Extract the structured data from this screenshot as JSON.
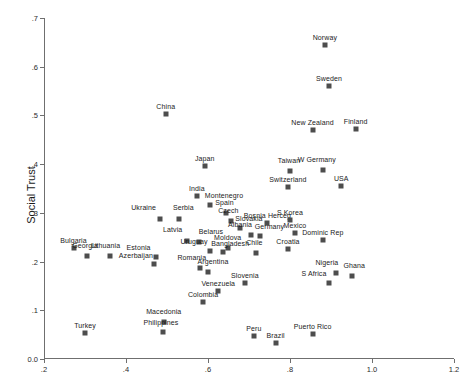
{
  "chart_data": {
    "type": "scatter",
    "title": "",
    "xlabel": "",
    "ylabel": "Social Trust",
    "xlim": [
      0.2,
      1.2
    ],
    "ylim": [
      0.0,
      0.7
    ],
    "xticks": [
      0.2,
      0.4,
      0.6,
      0.8,
      1.0,
      1.2
    ],
    "xtick_labels": [
      ".2",
      ".4",
      ".6",
      ".8",
      "1.0",
      "1.2"
    ],
    "yticks": [
      0.0,
      0.1,
      0.2,
      0.3,
      0.4,
      0.5,
      0.6,
      0.7
    ],
    "ytick_labels": [
      "0.0",
      ".1",
      ".2",
      ".3",
      ".4",
      ".5",
      ".6",
      ".7"
    ],
    "grid": false,
    "legend": false,
    "marker_color": "#4d4d4d",
    "axis_color": "#6f6f6f",
    "points": [
      {
        "label": "Norway",
        "x": 0.885,
        "y": 0.645
      },
      {
        "label": "Sweden",
        "x": 0.895,
        "y": 0.561
      },
      {
        "label": "China",
        "x": 0.497,
        "y": 0.502
      },
      {
        "label": "Finland",
        "x": 0.96,
        "y": 0.472
      },
      {
        "label": "New Zealand",
        "x": 0.855,
        "y": 0.47
      },
      {
        "label": "Japan",
        "x": 0.592,
        "y": 0.396
      },
      {
        "label": "W Germany",
        "x": 0.88,
        "y": 0.388
      },
      {
        "label": "Taiwan",
        "x": 0.8,
        "y": 0.385
      },
      {
        "label": "USA",
        "x": 0.925,
        "y": 0.355
      },
      {
        "label": "Switzerland",
        "x": 0.795,
        "y": 0.354
      },
      {
        "label": "India",
        "x": 0.573,
        "y": 0.335
      },
      {
        "label": "Montenegro",
        "x": 0.605,
        "y": 0.316
      },
      {
        "label": "Spain",
        "x": 0.645,
        "y": 0.3
      },
      {
        "label": "Ukraine",
        "x": 0.482,
        "y": 0.288
      },
      {
        "label": "Serbia",
        "x": 0.53,
        "y": 0.287
      },
      {
        "label": "Czech",
        "x": 0.657,
        "y": 0.283
      },
      {
        "label": "Slovakia",
        "x": 0.678,
        "y": 0.269
      },
      {
        "label": "Bosnia Herceg",
        "x": 0.745,
        "y": 0.28
      },
      {
        "label": "S Korea",
        "x": 0.8,
        "y": 0.286
      },
      {
        "label": "Albania",
        "x": 0.705,
        "y": 0.254
      },
      {
        "label": "Germany",
        "x": 0.728,
        "y": 0.253
      },
      {
        "label": "Mexico",
        "x": 0.812,
        "y": 0.258
      },
      {
        "label": "Dominic Rep",
        "x": 0.88,
        "y": 0.245
      },
      {
        "label": "Latvia",
        "x": 0.548,
        "y": 0.243
      },
      {
        "label": "Belarus",
        "x": 0.578,
        "y": 0.24
      },
      {
        "label": "Moldova",
        "x": 0.648,
        "y": 0.228
      },
      {
        "label": "Uruguay",
        "x": 0.605,
        "y": 0.221
      },
      {
        "label": "Bangladesh",
        "x": 0.637,
        "y": 0.219
      },
      {
        "label": "Chile",
        "x": 0.718,
        "y": 0.217
      },
      {
        "label": "Croatia",
        "x": 0.795,
        "y": 0.226
      },
      {
        "label": "Bulgaria",
        "x": 0.272,
        "y": 0.228
      },
      {
        "label": "Georgia",
        "x": 0.305,
        "y": 0.211
      },
      {
        "label": "Lithuania",
        "x": 0.36,
        "y": 0.211
      },
      {
        "label": "Estonia",
        "x": 0.472,
        "y": 0.209
      },
      {
        "label": "Azerbaijan",
        "x": 0.468,
        "y": 0.196
      },
      {
        "label": "Romania",
        "x": 0.58,
        "y": 0.186
      },
      {
        "label": "Argentina",
        "x": 0.6,
        "y": 0.178
      },
      {
        "label": "Nigeria",
        "x": 0.912,
        "y": 0.177
      },
      {
        "label": "Ghana",
        "x": 0.952,
        "y": 0.171
      },
      {
        "label": "S Africa",
        "x": 0.895,
        "y": 0.157
      },
      {
        "label": "Slovenia",
        "x": 0.69,
        "y": 0.156
      },
      {
        "label": "Venezuela",
        "x": 0.625,
        "y": 0.14
      },
      {
        "label": "Colombia",
        "x": 0.588,
        "y": 0.118
      },
      {
        "label": "Macedonia",
        "x": 0.492,
        "y": 0.075
      },
      {
        "label": "Philippines",
        "x": 0.49,
        "y": 0.056
      },
      {
        "label": "Turkey",
        "x": 0.3,
        "y": 0.053
      },
      {
        "label": "Peru",
        "x": 0.712,
        "y": 0.048
      },
      {
        "label": "Puerto Rico",
        "x": 0.855,
        "y": 0.052
      },
      {
        "label": "Brazil",
        "x": 0.765,
        "y": 0.032
      }
    ],
    "label_offsets": {
      "Ukraine": {
        "dx": -16,
        "dy": -4
      },
      "Serbia": {
        "dx": 4,
        "dy": -4
      },
      "Latvia": {
        "dx": -14,
        "dy": -4
      },
      "Belarus": {
        "dx": 12,
        "dy": -3
      },
      "Estonia": {
        "dx": -17,
        "dy": -2
      },
      "Azerbaijan": {
        "dx": -18,
        "dy": -1
      },
      "Georgia": {
        "dx": -2,
        "dy": -3
      },
      "Lithuania": {
        "dx": -4,
        "dy": -3
      },
      "Uruguay": {
        "dx": -16,
        "dy": -2
      },
      "Bangladesh": {
        "dx": 7,
        "dy": -1
      },
      "Albania": {
        "dx": -11,
        "dy": -3
      },
      "Germany": {
        "dx": 9,
        "dy": -2
      },
      "Argentina": {
        "dx": 5,
        "dy": -3
      },
      "Romania": {
        "dx": -8,
        "dy": -3
      },
      "Nigeria": {
        "dx": -9,
        "dy": -3
      },
      "Ghana": {
        "dx": 2,
        "dy": -3
      },
      "S Africa": {
        "dx": -15,
        "dy": -2
      },
      "Taiwan": {
        "dx": -1,
        "dy": -3
      },
      "W Germany": {
        "dx": -6,
        "dy": -3
      },
      "Philippines": {
        "dx": -2,
        "dy": -2
      },
      "Macedonia": {
        "dx": 0,
        "dy": -3
      },
      "Montenegro": {
        "dx": 14,
        "dy": -2
      },
      "Spain": {
        "dx": -2,
        "dy": -3
      },
      "Czech": {
        "dx": -3,
        "dy": -3
      },
      "Slovakia": {
        "dx": 9,
        "dy": -2
      },
      "Moldova": {
        "dx": 0,
        "dy": -3
      },
      "Chile": {
        "dx": -2,
        "dy": -3
      }
    }
  }
}
